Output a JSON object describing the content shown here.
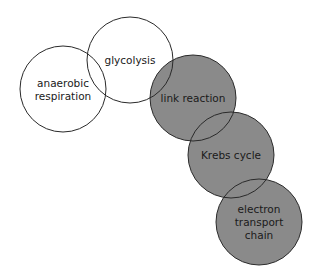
{
  "diagram": {
    "nodes": [
      {
        "id": "anaerobic-respiration",
        "lines": [
          "anaerobic",
          "respiration"
        ],
        "filled": false
      },
      {
        "id": "glycolysis",
        "lines": [
          "glycolysis"
        ],
        "filled": false
      },
      {
        "id": "link-reaction",
        "lines": [
          "link reaction"
        ],
        "filled": true
      },
      {
        "id": "krebs-cycle",
        "lines": [
          "Krebs cycle"
        ],
        "filled": true
      },
      {
        "id": "electron-transport-chain",
        "lines": [
          "electron",
          "transport",
          "chain"
        ],
        "filled": true
      }
    ],
    "colors": {
      "filled": "#8a8a8a",
      "unfilled": "#ffffff",
      "stroke": "#2a2a2a"
    }
  }
}
